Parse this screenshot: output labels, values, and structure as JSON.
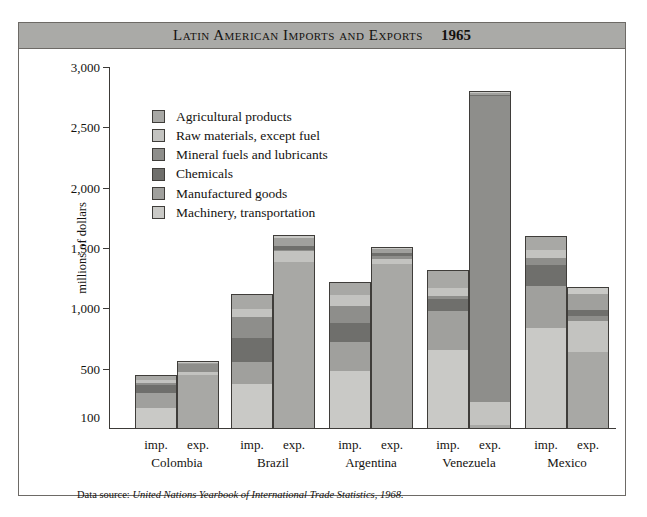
{
  "figure": {
    "title": "Latin American Imports and Exports",
    "year": "1965",
    "footnote_prefix": "Data source: ",
    "footnote_source": "United Nations Yearbook of International Trade Statistics, 1968."
  },
  "legend": {
    "items": [
      {
        "label": "Agricultural products",
        "color": "#a8a8a5"
      },
      {
        "label": "Raw materials, except fuel",
        "color": "#c3c3c0"
      },
      {
        "label": "Mineral fuels and lubricants",
        "color": "#8e8e8b"
      },
      {
        "label": "Chemicals",
        "color": "#6f6f6c"
      },
      {
        "label": "Manufactured goods",
        "color": "#a0a09d"
      },
      {
        "label": "Machinery, transportation",
        "color": "#c9c9c6"
      }
    ]
  },
  "chart_data": {
    "type": "bar",
    "subtype": "stacked-grouped-column",
    "title": "Latin American Imports and Exports 1965",
    "xlabel": "",
    "ylabel": "millions of dollars",
    "ylim": [
      0,
      3000
    ],
    "yticks": [
      3000,
      2500,
      2000,
      1500,
      1000,
      500,
      100
    ],
    "ytick_labels": [
      "3,000",
      "2,500",
      "2,000",
      "1,500",
      "1,000",
      "500",
      "100"
    ],
    "grid": false,
    "legend_position": "upper-left-inside",
    "categories": [
      "Colombia",
      "Brazil",
      "Argentina",
      "Venezuela",
      "Mexico"
    ],
    "subcategories": [
      "imp.",
      "exp."
    ],
    "series": [
      {
        "name": "Agricultural products",
        "color": "#a8a8a5"
      },
      {
        "name": "Raw materials, except fuel",
        "color": "#c3c3c0"
      },
      {
        "name": "Mineral fuels and lubricants",
        "color": "#8e8e8b"
      },
      {
        "name": "Chemicals",
        "color": "#6f6f6c"
      },
      {
        "name": "Manufactured goods",
        "color": "#a0a09d"
      },
      {
        "name": "Machinery, transportation",
        "color": "#c9c9c6"
      }
    ],
    "bars": [
      {
        "country": "Colombia",
        "kind": "imp.",
        "total": 450,
        "segments": [
          {
            "name": "Agricultural products",
            "value": 40
          },
          {
            "name": "Raw materials, except fuel",
            "value": 25
          },
          {
            "name": "Mineral fuels and lubricants",
            "value": 15
          },
          {
            "name": "Chemicals",
            "value": 70
          },
          {
            "name": "Manufactured goods",
            "value": 130
          },
          {
            "name": "Machinery, transportation",
            "value": 170
          }
        ]
      },
      {
        "country": "Colombia",
        "kind": "exp.",
        "total": 560,
        "segments": [
          {
            "name": "Agricultural products",
            "value": 450
          },
          {
            "name": "Raw materials, except fuel",
            "value": 30
          },
          {
            "name": "Mineral fuels and lubricants",
            "value": 65
          },
          {
            "name": "Chemicals",
            "value": 5
          },
          {
            "name": "Manufactured goods",
            "value": 8
          },
          {
            "name": "Machinery, transportation",
            "value": 2
          }
        ]
      },
      {
        "country": "Brazil",
        "kind": "imp.",
        "total": 1120,
        "segments": [
          {
            "name": "Agricultural products",
            "value": 120
          },
          {
            "name": "Raw materials, except fuel",
            "value": 70
          },
          {
            "name": "Mineral fuels and lubricants",
            "value": 175
          },
          {
            "name": "Chemicals",
            "value": 200
          },
          {
            "name": "Manufactured goods",
            "value": 185
          },
          {
            "name": "Machinery, transportation",
            "value": 370
          }
        ]
      },
      {
        "country": "Brazil",
        "kind": "exp.",
        "total": 1610,
        "segments": [
          {
            "name": "Agricultural products",
            "value": 1390
          },
          {
            "name": "Raw materials, except fuel",
            "value": 90
          },
          {
            "name": "Mineral fuels and lubricants",
            "value": 10
          },
          {
            "name": "Chemicals",
            "value": 30
          },
          {
            "name": "Manufactured goods",
            "value": 75
          },
          {
            "name": "Machinery, transportation",
            "value": 15
          }
        ]
      },
      {
        "country": "Argentina",
        "kind": "imp.",
        "total": 1220,
        "segments": [
          {
            "name": "Agricultural products",
            "value": 100
          },
          {
            "name": "Raw materials, except fuel",
            "value": 95
          },
          {
            "name": "Mineral fuels and lubricants",
            "value": 140
          },
          {
            "name": "Chemicals",
            "value": 160
          },
          {
            "name": "Manufactured goods",
            "value": 245
          },
          {
            "name": "Machinery, transportation",
            "value": 480
          }
        ]
      },
      {
        "country": "Argentina",
        "kind": "exp.",
        "total": 1510,
        "segments": [
          {
            "name": "Agricultural products",
            "value": 1370
          },
          {
            "name": "Raw materials, except fuel",
            "value": 50
          },
          {
            "name": "Mineral fuels and lubricants",
            "value": 20
          },
          {
            "name": "Chemicals",
            "value": 25
          },
          {
            "name": "Manufactured goods",
            "value": 35
          },
          {
            "name": "Machinery, transportation",
            "value": 10
          }
        ]
      },
      {
        "country": "Venezuela",
        "kind": "imp.",
        "total": 1320,
        "segments": [
          {
            "name": "Agricultural products",
            "value": 145
          },
          {
            "name": "Raw materials, except fuel",
            "value": 65
          },
          {
            "name": "Mineral fuels and lubricants",
            "value": 30
          },
          {
            "name": "Chemicals",
            "value": 95
          },
          {
            "name": "Manufactured goods",
            "value": 330
          },
          {
            "name": "Machinery, transportation",
            "value": 655
          }
        ]
      },
      {
        "country": "Venezuela",
        "kind": "exp.",
        "total": 2800,
        "segments": [
          {
            "name": "Agricultural products",
            "value": 25
          },
          {
            "name": "Raw materials, except fuel",
            "value": 195
          },
          {
            "name": "Mineral fuels and lubricants",
            "value": 2550
          },
          {
            "name": "Chemicals",
            "value": 10
          },
          {
            "name": "Manufactured goods",
            "value": 15
          },
          {
            "name": "Machinery, transportation",
            "value": 5
          }
        ]
      },
      {
        "country": "Mexico",
        "kind": "imp.",
        "total": 1600,
        "segments": [
          {
            "name": "Agricultural products",
            "value": 110
          },
          {
            "name": "Raw materials, except fuel",
            "value": 70
          },
          {
            "name": "Mineral fuels and lubricants",
            "value": 55
          },
          {
            "name": "Chemicals",
            "value": 175
          },
          {
            "name": "Manufactured goods",
            "value": 350
          },
          {
            "name": "Machinery, transportation",
            "value": 840
          }
        ]
      },
      {
        "country": "Mexico",
        "kind": "exp.",
        "total": 1180,
        "segments": [
          {
            "name": "Agricultural products",
            "value": 640
          },
          {
            "name": "Raw materials, except fuel",
            "value": 255
          },
          {
            "name": "Mineral fuels and lubricants",
            "value": 45
          },
          {
            "name": "Chemicals",
            "value": 55
          },
          {
            "name": "Manufactured goods",
            "value": 130
          },
          {
            "name": "Machinery, transportation",
            "value": 55
          }
        ]
      }
    ]
  }
}
